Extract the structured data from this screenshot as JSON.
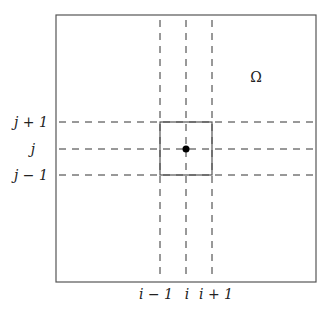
{
  "diagram": {
    "type": "finite-difference-grid-stencil",
    "domain_label": "Ω",
    "column_labels": [
      "i − 1",
      "i",
      "i + 1"
    ],
    "row_labels": [
      "j + 1",
      "j",
      "j − 1"
    ],
    "colors": {
      "line": "#444444",
      "dashed": "#333333",
      "point": "#000000"
    },
    "geometry": {
      "outer_box": {
        "x": 56,
        "y": 15,
        "w": 260,
        "h": 267
      },
      "cell_box": {
        "x": 160,
        "y": 122,
        "w": 52,
        "h": 53
      },
      "center_point": {
        "x": 186,
        "y": 149,
        "r": 3.5
      },
      "vertical_lines_x": [
        160,
        186,
        212
      ],
      "horizontal_lines_y": [
        122,
        149,
        175
      ]
    }
  }
}
